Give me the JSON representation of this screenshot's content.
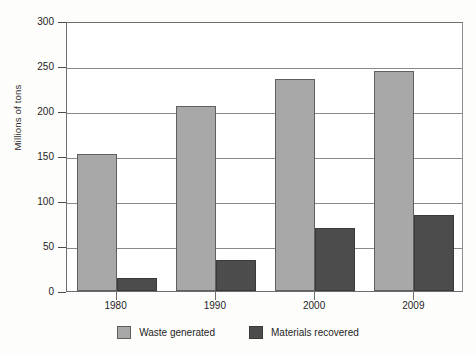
{
  "chart_data": {
    "type": "bar",
    "title": "",
    "xlabel": "",
    "ylabel": "Millions of tons",
    "categories": [
      "1980",
      "1990",
      "2000",
      "2009"
    ],
    "series": [
      {
        "name": "Waste generated",
        "color": "#a8a8a8",
        "values": [
          152,
          206,
          236,
          245
        ]
      },
      {
        "name": "Materials recovered",
        "color": "#4c4c4c",
        "values": [
          15,
          35,
          70,
          85
        ]
      }
    ],
    "ylim": [
      0,
      300
    ],
    "yticks": [
      0,
      50,
      100,
      150,
      200,
      250,
      300
    ],
    "ytick_labels": [
      "0",
      "50",
      "100",
      "150",
      "200",
      "250",
      "300"
    ],
    "grid": "horizontal",
    "legend_position": "bottom-center"
  },
  "legend": {
    "items": [
      {
        "label": "Waste generated",
        "swatch": "light-gray-square"
      },
      {
        "label": "Materials recovered",
        "swatch": "dark-gray-square"
      }
    ]
  }
}
